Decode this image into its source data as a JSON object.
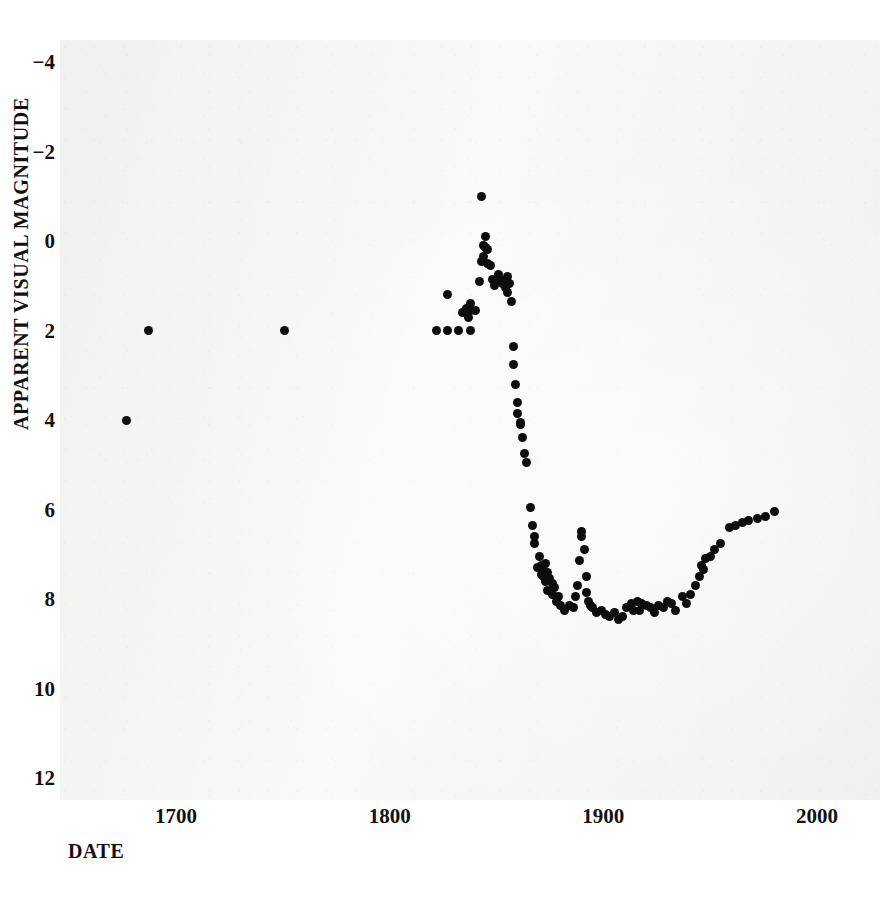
{
  "chart_data": {
    "type": "scatter",
    "title": "",
    "xlabel": "DATE",
    "ylabel": "APPARENT VISUAL MAGNITUDE",
    "xlim": [
      1655,
      2010
    ],
    "ylim": [
      -5.0,
      13.0
    ],
    "y_inverted": true,
    "grid": false,
    "legend": null,
    "xticks": [
      1700,
      1800,
      1900,
      2000
    ],
    "xtick_labels": [
      "1700",
      "1800",
      "1900",
      "2000"
    ],
    "yticks": [
      -4,
      -2,
      0,
      2,
      4,
      6,
      8,
      10,
      12
    ],
    "ytick_labels": [
      "−4",
      "−2",
      "0",
      "2",
      "4",
      "6",
      "8",
      "10",
      "12"
    ],
    "marker": "filled-circle",
    "marker_color": "#0d0d0d",
    "marker_size_px": 9,
    "background_color": "#f3f3f2",
    "page_color": "#ffffff",
    "points": [
      [
        1677,
        4.0
      ],
      [
        1687,
        2.0
      ],
      [
        1751,
        2.0
      ],
      [
        1822,
        2.0
      ],
      [
        1827,
        2.0
      ],
      [
        1832,
        2.0
      ],
      [
        1838,
        2.0
      ],
      [
        1827,
        1.2
      ],
      [
        1834,
        1.6
      ],
      [
        1836,
        1.5
      ],
      [
        1837,
        1.7
      ],
      [
        1838,
        1.4
      ],
      [
        1838,
        1.55
      ],
      [
        1840,
        1.55
      ],
      [
        1842,
        0.9
      ],
      [
        1843,
        0.45
      ],
      [
        1843,
        -1.0
      ],
      [
        1844,
        0.1
      ],
      [
        1844,
        0.35
      ],
      [
        1845,
        -0.1
      ],
      [
        1845,
        0.15
      ],
      [
        1846,
        0.2
      ],
      [
        1846,
        0.5
      ],
      [
        1847,
        0.55
      ],
      [
        1848,
        0.85
      ],
      [
        1849,
        1.0
      ],
      [
        1851,
        0.75
      ],
      [
        1852,
        0.85
      ],
      [
        1853,
        0.95
      ],
      [
        1854,
        1.05
      ],
      [
        1855,
        1.15
      ],
      [
        1855,
        0.8
      ],
      [
        1856,
        0.95
      ],
      [
        1857,
        1.35
      ],
      [
        1858,
        2.35
      ],
      [
        1858,
        2.75
      ],
      [
        1859,
        3.2
      ],
      [
        1860,
        3.6
      ],
      [
        1860,
        3.85
      ],
      [
        1861,
        4.05
      ],
      [
        1861,
        4.1
      ],
      [
        1862,
        4.4
      ],
      [
        1863,
        4.75
      ],
      [
        1864,
        4.95
      ],
      [
        1866,
        5.95
      ],
      [
        1867,
        6.35
      ],
      [
        1868,
        6.6
      ],
      [
        1868,
        6.75
      ],
      [
        1869,
        7.3
      ],
      [
        1870,
        7.05
      ],
      [
        1871,
        7.25
      ],
      [
        1871,
        7.45
      ],
      [
        1872,
        7.35
      ],
      [
        1872,
        7.5
      ],
      [
        1873,
        7.2
      ],
      [
        1873,
        7.6
      ],
      [
        1874,
        7.4
      ],
      [
        1874,
        7.8
      ],
      [
        1875,
        7.55
      ],
      [
        1876,
        7.65
      ],
      [
        1876,
        7.9
      ],
      [
        1877,
        7.75
      ],
      [
        1878,
        8.05
      ],
      [
        1879,
        7.95
      ],
      [
        1880,
        8.15
      ],
      [
        1882,
        8.25
      ],
      [
        1884,
        8.15
      ],
      [
        1886,
        8.2
      ],
      [
        1887,
        7.95
      ],
      [
        1888,
        7.7
      ],
      [
        1889,
        7.15
      ],
      [
        1890,
        6.6
      ],
      [
        1890,
        6.5
      ],
      [
        1891,
        6.9
      ],
      [
        1892,
        7.5
      ],
      [
        1892,
        7.85
      ],
      [
        1893,
        8.05
      ],
      [
        1894,
        8.15
      ],
      [
        1895,
        8.2
      ],
      [
        1897,
        8.3
      ],
      [
        1899,
        8.25
      ],
      [
        1901,
        8.35
      ],
      [
        1903,
        8.4
      ],
      [
        1905,
        8.3
      ],
      [
        1907,
        8.45
      ],
      [
        1909,
        8.4
      ],
      [
        1911,
        8.2
      ],
      [
        1913,
        8.1
      ],
      [
        1914,
        8.25
      ],
      [
        1916,
        8.05
      ],
      [
        1917,
        8.25
      ],
      [
        1918,
        8.1
      ],
      [
        1920,
        8.15
      ],
      [
        1922,
        8.2
      ],
      [
        1924,
        8.3
      ],
      [
        1926,
        8.15
      ],
      [
        1928,
        8.2
      ],
      [
        1930,
        8.05
      ],
      [
        1932,
        8.1
      ],
      [
        1934,
        8.25
      ],
      [
        1937,
        7.95
      ],
      [
        1939,
        8.1
      ],
      [
        1941,
        7.9
      ],
      [
        1943,
        7.7
      ],
      [
        1945,
        7.5
      ],
      [
        1946,
        7.25
      ],
      [
        1947,
        7.35
      ],
      [
        1948,
        7.1
      ],
      [
        1950,
        7.05
      ],
      [
        1952,
        6.9
      ],
      [
        1955,
        6.75
      ],
      [
        1959,
        6.4
      ],
      [
        1962,
        6.35
      ],
      [
        1965,
        6.3
      ],
      [
        1968,
        6.25
      ],
      [
        1972,
        6.2
      ],
      [
        1976,
        6.15
      ],
      [
        1980,
        6.05
      ]
    ]
  }
}
